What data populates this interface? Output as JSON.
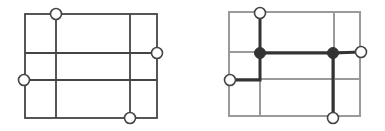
{
  "colors": {
    "background": "#ffffff",
    "grid_dark": "#444444",
    "grid_light": "#9a9a9a",
    "path": "#333333",
    "terminal_fill": "#ffffff",
    "terminal_stroke": "#444444",
    "junction_fill": "#333333"
  },
  "diagrams": [
    {
      "name": "grid-with-terminals",
      "grid": {
        "outer": {
          "x1": 25,
          "y1": 14,
          "x2": 157,
          "y2": 118
        },
        "vertical_lines_x": [
          56,
          130
        ],
        "horizontal_lines_y": [
          53,
          80
        ]
      },
      "terminals": [
        {
          "x": 56,
          "y": 14
        },
        {
          "x": 157,
          "y": 53
        },
        {
          "x": 24,
          "y": 80
        },
        {
          "x": 130,
          "y": 118
        }
      ]
    },
    {
      "name": "grid-with-steiner-tree",
      "grid": {
        "outer": {
          "x1": 229,
          "y1": 12,
          "x2": 360,
          "y2": 116
        },
        "vertical_lines_x": [
          260,
          334
        ],
        "horizontal_lines_y": [
          52,
          79
        ]
      },
      "terminals": [
        {
          "x": 260,
          "y": 13
        },
        {
          "x": 361,
          "y": 52
        },
        {
          "x": 230,
          "y": 80
        },
        {
          "x": 333,
          "y": 118
        }
      ],
      "junctions": [
        {
          "x": 260,
          "y": 53
        },
        {
          "x": 333,
          "y": 53
        }
      ],
      "tree_paths": [
        "M260,13 L260,53 L333,53 L361,52",
        "M260,53 L260,80 L230,80",
        "M333,53 L333,118"
      ]
    }
  ]
}
